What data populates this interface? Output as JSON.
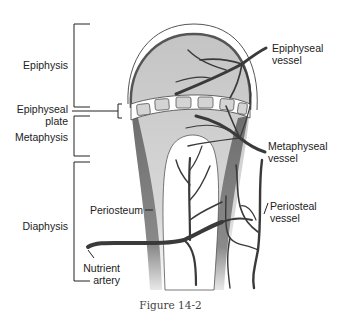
{
  "figure": {
    "caption": "Figure 14-2",
    "colors": {
      "bone_fill": "#c8c8c8",
      "periosteum": "#7a7a7a",
      "vessel": "#3a3a3a",
      "outline": "#555555",
      "background": "#ffffff"
    }
  },
  "left_labels": {
    "epiphysis": "Epiphysis",
    "epiphyseal_plate_line1": "Epiphyseal",
    "epiphyseal_plate_line2": "plate",
    "metaphysis": "Metaphysis",
    "diaphysis": "Diaphysis"
  },
  "inner_labels": {
    "periosteum": "Periosteum",
    "nutrient_artery_line1": "Nutrient",
    "nutrient_artery_line2": "artery"
  },
  "right_labels": {
    "epiphyseal_vessel_line1": "Epiphyseal",
    "epiphyseal_vessel_line2": "vessel",
    "metaphyseal_vessel_line1": "Metaphyseal",
    "metaphyseal_vessel_line2": "vessel",
    "periosteal_vessel_line1": "Periosteal",
    "periosteal_vessel_line2": "vessel"
  }
}
